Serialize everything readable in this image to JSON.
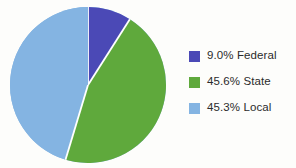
{
  "figure": {
    "background_color": "#fdfdfb",
    "text_color": "#2b2b2b"
  },
  "chart_data": {
    "type": "pie",
    "title": "",
    "subtitle": "",
    "xlabel": "",
    "ylabel": "",
    "grid": false,
    "legend_position": "right",
    "start_angle_deg": 90,
    "direction": "clockwise",
    "slice_separator_color": "#ffffff",
    "categories": [
      "Federal",
      "State",
      "Local"
    ],
    "values": [
      9.0,
      45.6,
      45.3
    ],
    "value_unit": "percent",
    "colors": [
      "#4b49b6",
      "#5fa93c",
      "#84b4e2"
    ],
    "data_labels": [
      "9.0% Federal",
      "45.6% State",
      "45.3% Local"
    ],
    "slices": [
      {
        "label": "Federal",
        "value": 9.0,
        "display": "9.0% Federal",
        "color": "#4b49b6"
      },
      {
        "label": "State",
        "value": 45.6,
        "display": "45.6% State",
        "color": "#5fa93c"
      },
      {
        "label": "Local",
        "value": 45.3,
        "display": "45.3% Local",
        "color": "#84b4e2"
      }
    ]
  },
  "legend": {
    "items": [
      {
        "swatch_color": "#4b49b6",
        "label": "9.0% Federal"
      },
      {
        "swatch_color": "#5fa93c",
        "label": "45.6% State"
      },
      {
        "swatch_color": "#84b4e2",
        "label": "45.3% Local"
      }
    ]
  }
}
